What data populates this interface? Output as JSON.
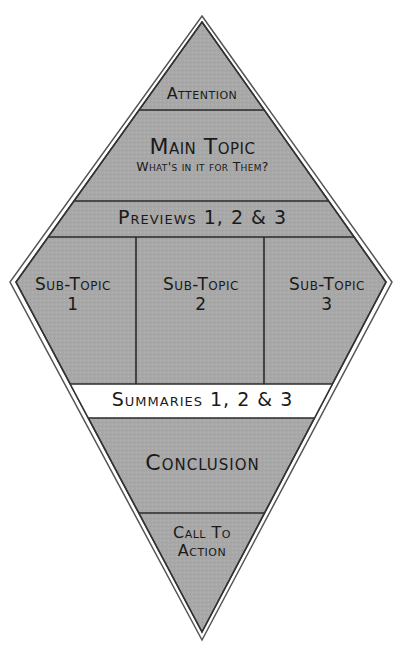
{
  "diagram": {
    "colors": {
      "fill": "#a9a9a9",
      "highlight_fill": "#ffffff",
      "line": "#2a2a2a",
      "outline": "#444444",
      "background": "#ffffff"
    },
    "sections": {
      "attention": "Attention",
      "main_topic": "Main Topic",
      "main_topic_subtitle": "What's in it for Them?",
      "previews": "Previews 1, 2 & 3",
      "sub_topics": [
        {
          "line1": "Sub-Topic",
          "line2": "1"
        },
        {
          "line1": "Sub-Topic",
          "line2": "2"
        },
        {
          "line1": "Sub-Topic",
          "line2": "3"
        }
      ],
      "summaries": "Summaries 1, 2 & 3",
      "conclusion": "Conclusion",
      "call_to_action": {
        "line1": "Call To",
        "line2": "Action"
      }
    }
  }
}
